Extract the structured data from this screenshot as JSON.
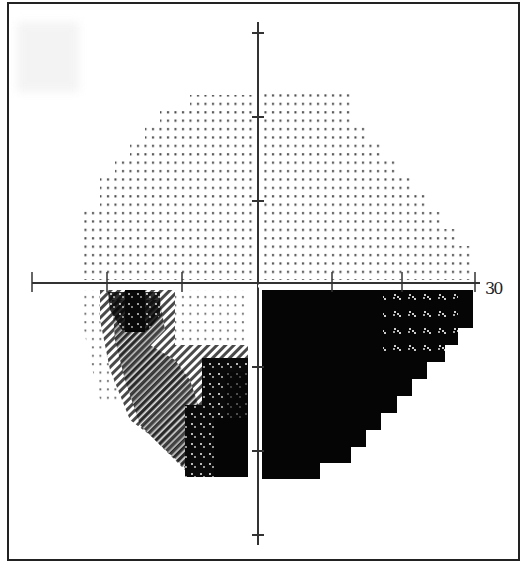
{
  "chart_data": {
    "type": "heatmap",
    "title": "",
    "xlabel": "",
    "ylabel": "",
    "axis_range_degrees": [
      -30,
      30
    ],
    "tick_interval_degrees": 10,
    "axis_tick_label": "30",
    "grid": false,
    "legend": null,
    "hemifields": {
      "superior": "normal sensitivity (sparse dot pattern), slight grey in near-central superior right",
      "inferior_nasal_right": "dense scotoma (solid black) with partial relative defect (speckled) at far periphery near horizontal meridian",
      "inferior_left": "mixed relative and absolute defects: dots at periphery, hatched grey band, solid black near vertical meridian and at 15-20 deg below fixation"
    },
    "grey_levels": [
      "dots",
      "light-hatch",
      "dark-hatch",
      "speckle-on-black",
      "black"
    ]
  },
  "axis": {
    "center": [
      258,
      283
    ],
    "x_ticks": [
      32,
      107,
      182,
      332,
      402,
      475
    ],
    "y_ticks": [
      33,
      117,
      201,
      367,
      451,
      535
    ],
    "label_30": "30"
  },
  "colors": {
    "frame": "#222222",
    "axis": "#333333",
    "dot": "#444444",
    "black": "#050505",
    "hatch": "#555555"
  },
  "regions": {
    "upper_left_rows": [
      {
        "y0": 95,
        "y1": 110,
        "x0": 190
      },
      {
        "y0": 110,
        "y1": 127,
        "x0": 160
      },
      {
        "y0": 127,
        "y1": 144,
        "x0": 145
      },
      {
        "y0": 144,
        "y1": 161,
        "x0": 130
      },
      {
        "y0": 161,
        "y1": 178,
        "x0": 115
      },
      {
        "y0": 178,
        "y1": 210,
        "x0": 100
      },
      {
        "y0": 210,
        "y1": 280,
        "x0": 84
      }
    ],
    "upper_right_rows": [
      {
        "y0": 90,
        "y1": 127,
        "x1": 352
      },
      {
        "y0": 127,
        "y1": 144,
        "x1": 365
      },
      {
        "y0": 144,
        "y1": 161,
        "x1": 380
      },
      {
        "y0": 161,
        "y1": 178,
        "x1": 395
      },
      {
        "y0": 178,
        "y1": 195,
        "x1": 410
      },
      {
        "y0": 195,
        "y1": 212,
        "x1": 425
      },
      {
        "y0": 212,
        "y1": 229,
        "x1": 440
      },
      {
        "y0": 229,
        "y1": 246,
        "x1": 455
      },
      {
        "y0": 246,
        "y1": 280,
        "x1": 470
      }
    ],
    "lower_right_black_rows": [
      {
        "y0": 290,
        "y1": 328,
        "x1": 473
      },
      {
        "y0": 328,
        "y1": 345,
        "x1": 458
      },
      {
        "y0": 345,
        "y1": 362,
        "x1": 442
      },
      {
        "y0": 362,
        "y1": 379,
        "x1": 427
      },
      {
        "y0": 379,
        "y1": 396,
        "x1": 412
      },
      {
        "y0": 396,
        "y1": 413,
        "x1": 397
      },
      {
        "y0": 413,
        "y1": 430,
        "x1": 381
      },
      {
        "y0": 430,
        "y1": 447,
        "x1": 366
      },
      {
        "y0": 447,
        "y1": 463,
        "x1": 351
      },
      {
        "y0": 463,
        "y1": 479,
        "x1": 320
      }
    ],
    "lower_right_speckle": {
      "x0": 383,
      "x1": 458,
      "y0": 290,
      "y1": 362
    }
  }
}
